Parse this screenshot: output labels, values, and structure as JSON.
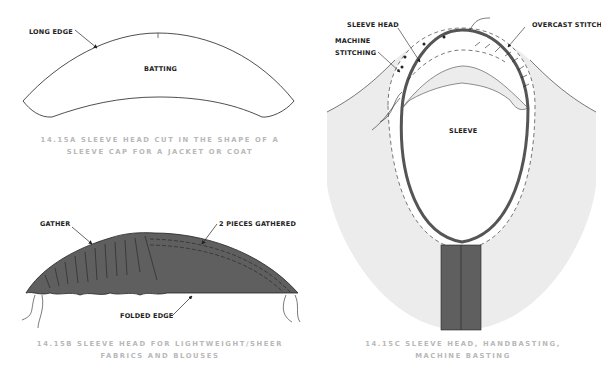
{
  "figures": {
    "a": {
      "labels": {
        "long_edge": "LONG EDGE",
        "batting": "BATTING"
      },
      "caption_line1": "14.15A  SLEEVE HEAD CUT IN THE SHAPE OF A",
      "caption_line2": "SLEEVE CAP FOR A JACKET OR COAT"
    },
    "b": {
      "labels": {
        "gather": "GATHER",
        "two_pieces": "2 PIECES GATHERED",
        "folded_edge": "FOLDED EDGE"
      },
      "caption_line1": "14.15B  SLEEVE HEAD FOR LIGHTWEIGHT/SHEER",
      "caption_line2": "FABRICS AND BLOUSES"
    },
    "c": {
      "labels": {
        "sleeve_head": "SLEEVE HEAD",
        "machine": "MACHINE",
        "stitching": "STITCHING",
        "overcast": "OVERCAST STITCH",
        "sleeve": "SLEEVE"
      },
      "caption_line1": "14.15C  SLEEVE HEAD, HANDBASTING,",
      "caption_line2": "MACHINE BASTING"
    }
  },
  "colors": {
    "fabric_dark": "#5f5f5f",
    "fabric_light": "#ececec",
    "line": "#222222",
    "caption": "#b8b8b8"
  }
}
